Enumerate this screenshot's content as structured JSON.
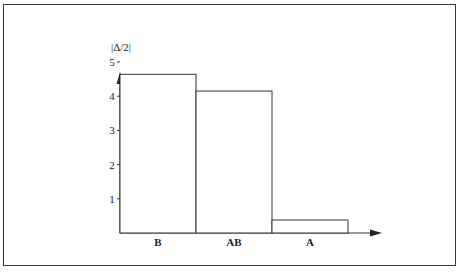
{
  "chart_data": {
    "type": "bar",
    "title": "",
    "xlabel": "",
    "ylabel": "|Δ/2|",
    "categories": [
      "B",
      "AB",
      "A"
    ],
    "values": [
      4.64,
      4.15,
      0.38
    ],
    "yticks": [
      "1",
      "2",
      "3",
      "4",
      "5"
    ],
    "ylim": [
      0,
      5.5
    ],
    "grid": false,
    "legend": null,
    "bar_style": {
      "fill": "#ffffff",
      "stroke": "#333333",
      "width_mode": "adjacent"
    }
  }
}
